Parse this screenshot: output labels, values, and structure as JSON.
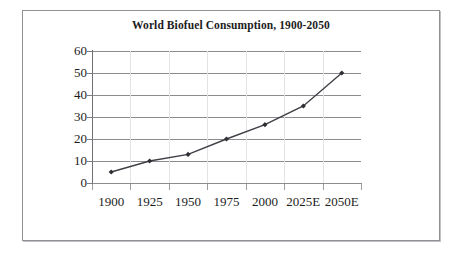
{
  "figure": {
    "frame_border_color": "#8f9194",
    "background": "#ffffff"
  },
  "chart_data": {
    "type": "line",
    "title": "World Biofuel Consumption, 1900-2050",
    "xlabel": "",
    "ylabel": "",
    "categories": [
      "1900",
      "1925",
      "1950",
      "1975",
      "2000",
      "2025E",
      "2050E"
    ],
    "values": [
      5,
      10,
      13,
      20,
      26.5,
      35,
      50
    ],
    "series": [
      {
        "name": "World Biofuel Consumption",
        "values": [
          5,
          10,
          13,
          20,
          26.5,
          35,
          50
        ]
      }
    ],
    "ylim": [
      0,
      60
    ],
    "ytick_labels": [
      "0",
      "10",
      "20",
      "30",
      "40",
      "50",
      "60"
    ],
    "ytick_values": [
      0,
      10,
      20,
      30,
      40,
      50,
      60
    ],
    "grid": "horizontal",
    "legend": "none",
    "line_color": "#3f3f46",
    "marker_color": "#2f2f35",
    "marker_shape": "diamond",
    "gridline_color": "#8a8c8f",
    "axis_color": "#7a7c7f",
    "text_color": "#1d1d1d"
  }
}
